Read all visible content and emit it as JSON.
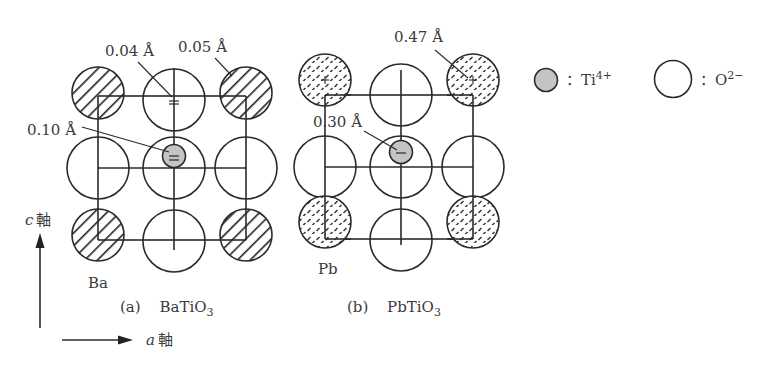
{
  "figure": {
    "panels": [
      {
        "id": "a",
        "caption_prefix": "(a)",
        "compound": "BaTiO",
        "compound_sub": "3",
        "a_site_label": "Ba",
        "a_site_pattern": "hatch-diagonal",
        "displacements": [
          {
            "label": "0.04 Å",
            "target": "top-center O2- ion"
          },
          {
            "label": "0.05 Å",
            "target": "top-right Ba ion"
          },
          {
            "label": "0.10 Å",
            "target": "center Ti4+ ion"
          }
        ]
      },
      {
        "id": "b",
        "caption_prefix": "(b)",
        "compound": "PbTiO",
        "compound_sub": "3",
        "a_site_label": "Pb",
        "a_site_pattern": "dashed-stipple",
        "displacements": [
          {
            "label": "0.47 Å",
            "target": "top-right Pb ion"
          },
          {
            "label": "0.30 Å",
            "target": "center Ti4+ ion"
          }
        ]
      }
    ],
    "legend": [
      {
        "symbol": "gray-filled-small-circle",
        "label": "：Ti",
        "sup": "4+"
      },
      {
        "symbol": "open-large-circle",
        "label": "：O",
        "sup": "2−"
      }
    ],
    "axes": {
      "c_axis": {
        "italic": "c",
        "kanji": "軸"
      },
      "a_axis": {
        "italic": "a",
        "kanji": "軸"
      }
    },
    "colors": {
      "line": "#2a2a2a",
      "ti_fill": "#c4c4c4",
      "text": "#3a3a3a"
    }
  }
}
